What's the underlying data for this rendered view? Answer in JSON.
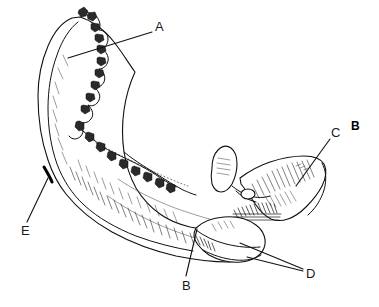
{
  "figure": {
    "panel_label": "B",
    "caption": "",
    "background_color": "#ffffff",
    "ink_color": "#111111",
    "width": 379,
    "height": 307
  },
  "labels": [
    {
      "id": "A",
      "text": "A",
      "x": 155,
      "y": 20,
      "leader": {
        "from_x": 152,
        "from_y": 32,
        "to_x": 68,
        "to_y": 58
      },
      "target": "alveolar-ridge"
    },
    {
      "id": "B",
      "text": "B",
      "x": 182,
      "y": 279,
      "leader": {
        "from_x": 186,
        "from_y": 276,
        "to_x": 197,
        "to_y": 229
      },
      "target": "inferior-border"
    },
    {
      "id": "C",
      "text": "C",
      "x": 331,
      "y": 126,
      "leader": {
        "from_x": 330,
        "from_y": 139,
        "to_x": 296,
        "to_y": 186
      },
      "target": "ramus"
    },
    {
      "id": "D",
      "text": "D",
      "x": 306,
      "y": 267,
      "leader": {
        "from_x": 303,
        "from_y": 269,
        "to_x": 240,
        "to_y": 243
      },
      "leader2": {
        "from_x": 303,
        "from_y": 271,
        "to_x": 247,
        "to_y": 257
      },
      "target": "condylar-process"
    },
    {
      "id": "E",
      "text": "E",
      "x": 21,
      "y": 224,
      "leader": {
        "from_x": 27,
        "from_y": 222,
        "to_x": 48,
        "to_y": 178
      },
      "target": "anterior-border"
    }
  ],
  "panel": {
    "label": "B",
    "x": 351,
    "y": 120
  }
}
